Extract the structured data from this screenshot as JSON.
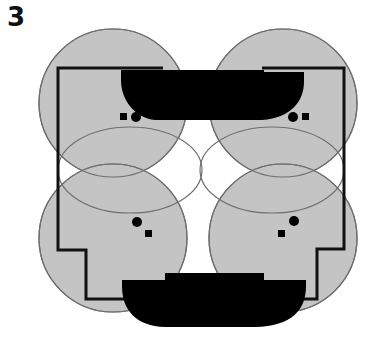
{
  "figure": {
    "label": "3"
  },
  "colors": {
    "zone_fill": "#c4c4c4",
    "zone_stroke": "#6e6e6e",
    "wall": "#111111",
    "furniture": "#000000",
    "background": "#ffffff"
  },
  "zones": [
    {
      "name": "top-left",
      "cx": 131,
      "cy": 117,
      "r": 91
    },
    {
      "name": "top-right",
      "cx": 279,
      "cy": 117,
      "r": 91
    },
    {
      "name": "bottom-left",
      "cx": 131,
      "cy": 222,
      "r": 91
    },
    {
      "name": "bottom-right",
      "cx": 279,
      "cy": 222,
      "r": 91
    }
  ],
  "markers": [
    {
      "name": "top-left",
      "circle": [
        135,
        117
      ],
      "square": [
        124,
        117
      ]
    },
    {
      "name": "top-right",
      "circle": [
        293,
        117
      ],
      "square": [
        305,
        117
      ]
    },
    {
      "name": "bottom-left",
      "circle": [
        137,
        222
      ],
      "square": [
        148,
        234
      ]
    },
    {
      "name": "bottom-right",
      "circle": [
        293,
        221
      ],
      "square": [
        281,
        234
      ]
    }
  ]
}
